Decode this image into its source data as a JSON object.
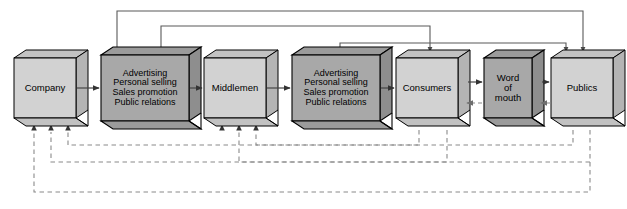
{
  "diagram": {
    "type": "flow-diagram",
    "colors": {
      "box_light_face": "#d2d2d2",
      "box_dark_face": "#a8a8a8",
      "box_light_side": "#b4b4b4",
      "box_dark_side": "#8e8e8e",
      "box_light_bottom": "#c2c2c2",
      "box_dark_bottom": "#9b9b9b",
      "outline": "#000000",
      "solid_connector": "#595959",
      "dashed_connector": "#8a8a8a",
      "background": "#ffffff"
    },
    "nodes": [
      {
        "id": "company",
        "label": "Company",
        "shade": "light",
        "x": 14,
        "y": 58,
        "w": 62,
        "h": 60,
        "lines": 1
      },
      {
        "id": "promo1",
        "label": "Advertising\nPersonal selling\nSales promotion\nPublic relations",
        "shade": "dark",
        "x": 101,
        "y": 55,
        "w": 88,
        "h": 66,
        "lines": 4
      },
      {
        "id": "middlemen",
        "label": "Middlemen",
        "shade": "light",
        "x": 204,
        "y": 58,
        "w": 62,
        "h": 60,
        "lines": 1
      },
      {
        "id": "promo2",
        "label": "Advertising\nPersonal selling\nSales promotion\nPublic relations",
        "shade": "dark",
        "x": 292,
        "y": 55,
        "w": 88,
        "h": 66,
        "lines": 4
      },
      {
        "id": "consumers",
        "label": "Consumers",
        "shade": "light",
        "x": 396,
        "y": 58,
        "w": 62,
        "h": 60,
        "lines": 1
      },
      {
        "id": "wordofmouth",
        "label": "Word\nof\nmouth",
        "shade": "dark",
        "x": 484,
        "y": 58,
        "w": 48,
        "h": 60,
        "lines": 3
      },
      {
        "id": "publics",
        "label": "Publics",
        "shade": "light",
        "x": 551,
        "y": 58,
        "w": 62,
        "h": 60,
        "lines": 1
      }
    ],
    "forward_flow": [
      {
        "from": "company",
        "to": "promo1",
        "style": "solid",
        "arrow": "right"
      },
      {
        "from": "promo1",
        "to": "middlemen",
        "style": "solid",
        "arrow": "right"
      },
      {
        "from": "middlemen",
        "to": "promo2",
        "style": "solid",
        "arrow": "right"
      },
      {
        "from": "promo2",
        "to": "consumers",
        "style": "solid",
        "arrow": "right"
      },
      {
        "from": "consumers",
        "to": "wordofmouth",
        "style": "solid",
        "arrow": "right"
      },
      {
        "from": "wordofmouth",
        "to": "publics",
        "style": "solid",
        "arrow": "right"
      },
      {
        "from": "wordofmouth",
        "to": "consumers",
        "style": "dashed",
        "arrow": "left"
      },
      {
        "from": "publics",
        "to": "wordofmouth",
        "style": "dashed",
        "arrow": "left"
      }
    ],
    "top_routes": [
      {
        "id": "promo1-to-publics",
        "from_x": 117,
        "to_x": 583,
        "y": 11,
        "style": "solid",
        "note": "Advertising block 1 up and over to Publics"
      },
      {
        "id": "promo1-to-consumers",
        "from_x": 161,
        "to_x": 430,
        "y": 26,
        "style": "solid",
        "note": "Advertising block 1 up and over to Consumers"
      },
      {
        "id": "promo2-to-publics",
        "from_x": 340,
        "to_x": 566,
        "y": 43,
        "style": "solid",
        "note": "Advertising block 2 up and over to Publics"
      }
    ],
    "bottom_routes": [
      {
        "id": "consumers-to-middlemen",
        "from_x": 419,
        "to_x": 256,
        "y": 145,
        "style": "dashed"
      },
      {
        "id": "publics-to-company",
        "from_x": 573,
        "to_x": 68,
        "y": 145,
        "style": "dashed"
      },
      {
        "id": "consumers-to-company",
        "from_x": 447,
        "to_x": 51,
        "y": 162,
        "style": "dashed"
      },
      {
        "id": "publics-to-middlemen",
        "from_x": 590,
        "to_x": 239,
        "y": 162,
        "style": "dashed"
      },
      {
        "id": "publics-to-company-2",
        "from_x": 590,
        "to_x": 34,
        "y": 192,
        "style": "dashed"
      }
    ],
    "feedback_arrow_targets": {
      "company": [
        34,
        51,
        68
      ],
      "middlemen": [
        222,
        239,
        256
      ]
    }
  }
}
